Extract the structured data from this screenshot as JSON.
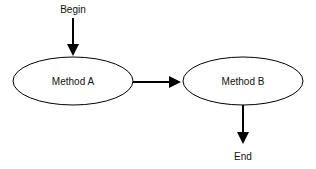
{
  "diagram": {
    "type": "flowchart",
    "nodes": [
      {
        "id": "begin",
        "label": "Begin",
        "shape": "text"
      },
      {
        "id": "method_a",
        "label": "Method A",
        "shape": "ellipse"
      },
      {
        "id": "method_b",
        "label": "Method B",
        "shape": "ellipse"
      },
      {
        "id": "end",
        "label": "End",
        "shape": "text"
      }
    ],
    "edges": [
      {
        "from": "begin",
        "to": "method_a",
        "direction": "down"
      },
      {
        "from": "method_a",
        "to": "method_b",
        "direction": "right"
      },
      {
        "from": "method_b",
        "to": "end",
        "direction": "down"
      }
    ],
    "colors": {
      "stroke": "#000000",
      "text": "#111111",
      "background": "#ffffff"
    }
  }
}
